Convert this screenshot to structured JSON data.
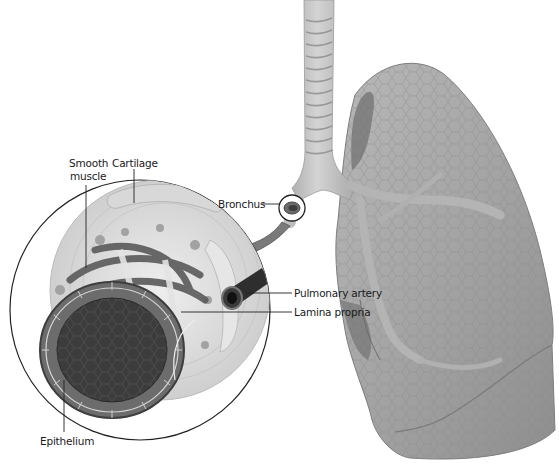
{
  "figure": {
    "colors": {
      "background": "#ffffff",
      "lung": "#9a9a9a",
      "lung_light": "#b4b4b4",
      "trachea": "#c4c4c4",
      "tissue": "#dcdcdc",
      "epithelium_lumen": "#3c3c3c",
      "arrow": "#7a7a7a",
      "leader_line": "#222222"
    }
  },
  "labels": {
    "smooth_muscle_line1": "Smooth",
    "smooth_muscle_line2": "muscle",
    "cartilage": "Cartilage",
    "bronchus": "Bronchus",
    "pulmonary_artery": "Pulmonary  artery",
    "lamina_propria": "Lamina propria",
    "epithelium": "Epithelium"
  }
}
